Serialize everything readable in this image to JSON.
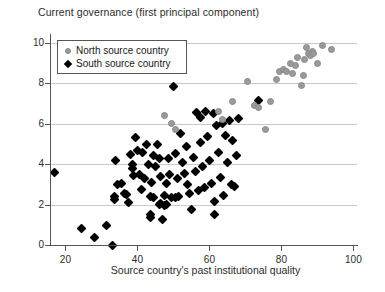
{
  "chart_data": {
    "type": "scatter",
    "title": "Current governance (first principal component)",
    "xlabel": "Source country's past institutional quality",
    "ylabel": "",
    "xlim": [
      16,
      101
    ],
    "ylim": [
      0,
      10.4
    ],
    "xticks": [
      20,
      40,
      60,
      80,
      100
    ],
    "yticks": [
      0,
      2,
      4,
      6,
      8,
      10
    ],
    "grid": "horizontal",
    "legend_position": "top-left",
    "colors": {
      "north": "#9a9a9a",
      "south": "#000000",
      "grid": "#c9c9c9",
      "axis": "#555555",
      "background": "#ffffff"
    },
    "series": [
      {
        "name": "North source country",
        "marker": "circle",
        "color": "#9a9a9a",
        "points": [
          [
            47.5,
            6.4
          ],
          [
            49.5,
            6.0
          ],
          [
            50.5,
            5.7
          ],
          [
            62.5,
            6.6
          ],
          [
            63.5,
            6.2
          ],
          [
            66.5,
            7.1
          ],
          [
            70.5,
            8.1
          ],
          [
            72.5,
            6.9
          ],
          [
            73.5,
            6.8
          ],
          [
            75.5,
            5.7
          ],
          [
            77.0,
            7.1
          ],
          [
            78.5,
            8.2
          ],
          [
            79.5,
            8.6
          ],
          [
            80.5,
            8.7
          ],
          [
            81.5,
            8.6
          ],
          [
            82.5,
            9.0
          ],
          [
            83.0,
            8.5
          ],
          [
            84.0,
            8.9
          ],
          [
            84.5,
            9.3
          ],
          [
            85.5,
            7.9
          ],
          [
            86.0,
            8.4
          ],
          [
            86.5,
            9.2
          ],
          [
            87.0,
            9.8
          ],
          [
            87.5,
            9.5
          ],
          [
            88.0,
            9.4
          ],
          [
            88.5,
            9.6
          ],
          [
            89.0,
            9.5
          ],
          [
            90.0,
            9.0
          ],
          [
            91.5,
            9.9
          ],
          [
            94.0,
            9.7
          ]
        ]
      },
      {
        "name": "South source country",
        "marker": "diamond",
        "color": "#000000",
        "points": [
          [
            17.0,
            3.6
          ],
          [
            24.5,
            0.8
          ],
          [
            28.0,
            0.35
          ],
          [
            31.5,
            0.95
          ],
          [
            33.0,
            0.0
          ],
          [
            33.5,
            2.4
          ],
          [
            33.5,
            2.25
          ],
          [
            34.0,
            4.2
          ],
          [
            34.5,
            3.0
          ],
          [
            35.5,
            3.05
          ],
          [
            36.5,
            2.55
          ],
          [
            37.0,
            2.5
          ],
          [
            37.5,
            2.1
          ],
          [
            38.0,
            4.5
          ],
          [
            38.5,
            4.0
          ],
          [
            38.5,
            3.8
          ],
          [
            39.0,
            3.45
          ],
          [
            39.5,
            5.3
          ],
          [
            40.0,
            4.7
          ],
          [
            40.5,
            3.5
          ],
          [
            41.0,
            2.75
          ],
          [
            41.5,
            4.6
          ],
          [
            42.0,
            3.3
          ],
          [
            42.5,
            5.0
          ],
          [
            43.0,
            4.0
          ],
          [
            43.5,
            2.4
          ],
          [
            43.5,
            1.5
          ],
          [
            43.5,
            1.35
          ],
          [
            44.0,
            3.1
          ],
          [
            44.5,
            4.45
          ],
          [
            44.5,
            2.35
          ],
          [
            45.0,
            3.9
          ],
          [
            45.5,
            5.0
          ],
          [
            46.0,
            4.3
          ],
          [
            46.0,
            2.0
          ],
          [
            46.5,
            3.4
          ],
          [
            46.5,
            2.05
          ],
          [
            47.0,
            1.25
          ],
          [
            47.5,
            2.45
          ],
          [
            47.5,
            1.95
          ],
          [
            48.0,
            3.05
          ],
          [
            48.0,
            2.0
          ],
          [
            48.5,
            4.3
          ],
          [
            49.0,
            3.5
          ],
          [
            49.5,
            2.35
          ],
          [
            50.0,
            7.85
          ],
          [
            50.5,
            2.35
          ],
          [
            50.5,
            4.55
          ],
          [
            51.0,
            3.3
          ],
          [
            51.5,
            2.4
          ],
          [
            52.0,
            5.5
          ],
          [
            52.5,
            4.1
          ],
          [
            53.0,
            3.55
          ],
          [
            53.5,
            4.9
          ],
          [
            54.0,
            3.0
          ],
          [
            54.5,
            2.55
          ],
          [
            55.0,
            1.75
          ],
          [
            55.5,
            4.35
          ],
          [
            56.0,
            3.65
          ],
          [
            56.5,
            6.55
          ],
          [
            57.0,
            2.7
          ],
          [
            57.5,
            6.3
          ],
          [
            57.5,
            5.1
          ],
          [
            58.0,
            3.9
          ],
          [
            58.5,
            2.85
          ],
          [
            59.0,
            6.6
          ],
          [
            59.5,
            5.35
          ],
          [
            60.0,
            4.2
          ],
          [
            60.5,
            3.05
          ],
          [
            61.0,
            6.5
          ],
          [
            61.5,
            2.15
          ],
          [
            61.5,
            1.5
          ],
          [
            62.0,
            5.9
          ],
          [
            62.5,
            4.6
          ],
          [
            63.0,
            3.35
          ],
          [
            63.5,
            6.0
          ],
          [
            64.0,
            2.45
          ],
          [
            64.5,
            5.4
          ],
          [
            65.0,
            4.1
          ],
          [
            65.5,
            6.15
          ],
          [
            66.0,
            3.0
          ],
          [
            66.5,
            5.2
          ],
          [
            67.0,
            2.9
          ],
          [
            67.5,
            4.45
          ],
          [
            68.0,
            6.25
          ],
          [
            73.5,
            7.15
          ]
        ]
      }
    ]
  },
  "legend": {
    "entries": [
      {
        "label": "North source country",
        "marker": "circle"
      },
      {
        "label": "South source country",
        "marker": "diamond"
      }
    ]
  }
}
